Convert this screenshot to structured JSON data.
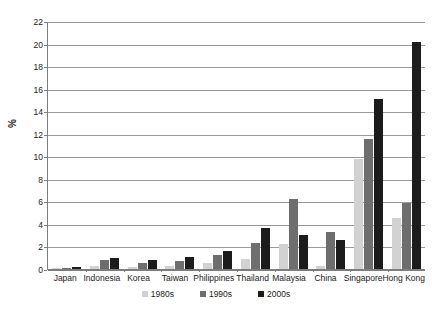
{
  "chart_data": {
    "type": "bar",
    "title": "",
    "xlabel": "",
    "ylabel": "%",
    "ylim": [
      0,
      22
    ],
    "yticks": [
      0,
      2,
      4,
      6,
      8,
      10,
      12,
      14,
      16,
      18,
      20,
      22
    ],
    "grid": true,
    "legend_position": "bottom",
    "categories": [
      "Japan",
      "Indonesia",
      "Korea",
      "Taiwan",
      "Philippines",
      "Thailand",
      "Malaysia",
      "China",
      "Singapore",
      "Hong Kong"
    ],
    "series": [
      {
        "name": "1980s",
        "color": "#d2d2d2",
        "values": [
          0.05,
          0.3,
          0.15,
          0.3,
          0.5,
          0.9,
          2.2,
          0.3,
          9.8,
          4.5
        ]
      },
      {
        "name": "1990s",
        "color": "#6e6e6e",
        "values": [
          0.1,
          0.8,
          0.5,
          0.7,
          1.2,
          2.3,
          6.2,
          3.3,
          11.5,
          5.9
        ]
      },
      {
        "name": "2000s",
        "color": "#1c1c1c",
        "values": [
          0.2,
          1.0,
          0.8,
          1.1,
          1.6,
          3.6,
          3.0,
          2.6,
          15.1,
          20.1
        ]
      }
    ]
  },
  "axis": {
    "y_label": "%"
  },
  "colors": {
    "series_1980s": "#d2d2d2",
    "series_1990s": "#6e6e6e",
    "series_2000s": "#1c1c1c",
    "gridline": "#9a9a9a",
    "axis": "#7d7d7d",
    "background": "#ffffff"
  }
}
